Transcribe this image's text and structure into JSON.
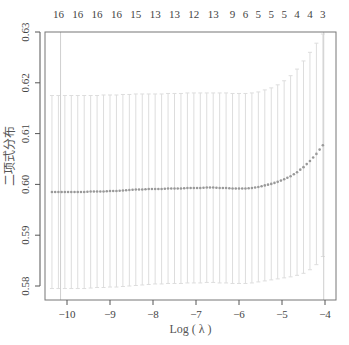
{
  "chart_data": {
    "type": "scatter",
    "title": "",
    "xlabel": "Log ( λ )",
    "ylabel": "二项式分布",
    "xlim": [
      -10.5,
      -3.75
    ],
    "ylim": [
      0.5775,
      0.63
    ],
    "x_ticks": [
      -10,
      -9,
      -8,
      -7,
      -6,
      -5,
      -4
    ],
    "y_ticks": [
      0.58,
      0.59,
      0.6,
      0.61,
      0.62,
      0.63
    ],
    "top_axis": {
      "labels": [
        "16",
        "16",
        "16",
        "16",
        "15",
        "13",
        "13",
        "12",
        "13",
        "9",
        "6",
        "5",
        "5",
        "5",
        "4",
        "4",
        "3"
      ],
      "positions": [
        -10.2,
        -9.75,
        -9.3,
        -8.85,
        -8.4,
        -7.95,
        -7.5,
        -7.05,
        -6.6,
        -6.15,
        -5.85,
        -5.55,
        -5.25,
        -4.95,
        -4.65,
        -4.35,
        -4.05
      ]
    },
    "vlines": [
      -10.15,
      -4.03
    ],
    "series": [
      {
        "name": "cross-validated binomial deviance",
        "marker_color": "#999999",
        "errorbar_color": "#d9d9d9",
        "x": [
          -10.35,
          -10.2,
          -10.05,
          -9.9,
          -9.75,
          -9.6,
          -9.45,
          -9.3,
          -9.15,
          -9.0,
          -8.85,
          -8.7,
          -8.55,
          -8.4,
          -8.25,
          -8.1,
          -7.95,
          -7.8,
          -7.65,
          -7.5,
          -7.35,
          -7.2,
          -7.05,
          -6.9,
          -6.75,
          -6.6,
          -6.45,
          -6.3,
          -6.15,
          -6.0,
          -5.85,
          -5.7,
          -5.55,
          -5.4,
          -5.25,
          -5.1,
          -4.95,
          -4.8,
          -4.65,
          -4.5,
          -4.35,
          -4.2,
          -4.05
        ],
        "y": [
          0.5985,
          0.5985,
          0.5985,
          0.5985,
          0.5985,
          0.5985,
          0.5986,
          0.5986,
          0.5986,
          0.5987,
          0.5987,
          0.5988,
          0.5989,
          0.599,
          0.599,
          0.5991,
          0.5991,
          0.5991,
          0.5992,
          0.5992,
          0.5992,
          0.5993,
          0.5993,
          0.5993,
          0.5994,
          0.5994,
          0.5993,
          0.5993,
          0.5992,
          0.5992,
          0.5992,
          0.5993,
          0.5995,
          0.5998,
          0.6001,
          0.6005,
          0.601,
          0.6016,
          0.6024,
          0.6034,
          0.6046,
          0.606,
          0.6077
        ],
        "upper": [
          0.6175,
          0.6175,
          0.6175,
          0.6175,
          0.6175,
          0.6175,
          0.6175,
          0.6175,
          0.6176,
          0.6176,
          0.6176,
          0.6177,
          0.6177,
          0.6178,
          0.6178,
          0.6178,
          0.6178,
          0.6178,
          0.6179,
          0.6179,
          0.6179,
          0.618,
          0.618,
          0.618,
          0.618,
          0.618,
          0.618,
          0.618,
          0.6179,
          0.6179,
          0.6179,
          0.618,
          0.6182,
          0.6186,
          0.619,
          0.6196,
          0.6204,
          0.6214,
          0.6227,
          0.6243,
          0.626,
          0.6278,
          0.6296
        ],
        "lower": [
          0.5795,
          0.5795,
          0.5795,
          0.5795,
          0.5795,
          0.5795,
          0.5796,
          0.5797,
          0.5797,
          0.5798,
          0.5798,
          0.5799,
          0.58,
          0.5801,
          0.5802,
          0.5803,
          0.5804,
          0.5804,
          0.5805,
          0.5805,
          0.5805,
          0.5806,
          0.5806,
          0.5806,
          0.5807,
          0.5807,
          0.5806,
          0.5806,
          0.5805,
          0.5805,
          0.5805,
          0.5806,
          0.5808,
          0.581,
          0.5812,
          0.5814,
          0.5816,
          0.5818,
          0.5821,
          0.5825,
          0.5832,
          0.5842,
          0.5858
        ]
      }
    ],
    "grid": false,
    "legend": "none"
  },
  "colors": {
    "axis": "#555555",
    "box": "#777777",
    "marker": "#999999",
    "errorbar": "#dddddd",
    "vline": "#cfcfcf"
  }
}
